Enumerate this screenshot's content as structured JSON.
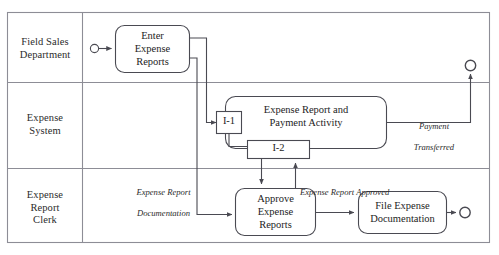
{
  "diagram": {
    "type": "activity-diagram-swimlanes",
    "colors": {
      "lane_border": "#8d8d96",
      "shape_stroke": "#4a4a52",
      "text": "#1d1d1d",
      "background": "#ffffff"
    },
    "lanes": [
      {
        "id": "lane-field-sales",
        "label": "Field Sales\nDepartment",
        "label_line1": "Field Sales",
        "label_line2": "Department"
      },
      {
        "id": "lane-expense-system",
        "label": "Expense\nSystem",
        "label_line1": "Expense",
        "label_line2": "System"
      },
      {
        "id": "lane-expense-report-clerk",
        "label": "Expense\nReport\nClerk",
        "label_line1": "Expense",
        "label_line2": "Report",
        "label_line3": "Clerk"
      }
    ],
    "activities": [
      {
        "id": "enter-expense-reports",
        "lane": "lane-field-sales",
        "lines": [
          "Enter",
          "Expense",
          "Reports"
        ]
      },
      {
        "id": "expense-report-and-payment-activity",
        "lane": "lane-expense-system",
        "lines": [
          "Expense Report and",
          "Payment Activity"
        ]
      },
      {
        "id": "approve-expense-reports",
        "lane": "lane-expense-report-clerk",
        "lines": [
          "Approve",
          "Expense",
          "Reports"
        ]
      },
      {
        "id": "file-expense-documentation",
        "lane": "lane-expense-report-clerk",
        "lines": [
          "File Expense",
          "Documentation"
        ]
      }
    ],
    "sync_bars": [
      {
        "id": "sync-bar-i1",
        "label": "I-1",
        "lane": "lane-expense-system"
      },
      {
        "id": "sync-bar-i2",
        "label": "I-2",
        "lane": "lane-expense-system"
      }
    ],
    "flow_labels": [
      {
        "id": "flow-label-payment-transferred",
        "line1": "Payment",
        "line2": "Transferred"
      },
      {
        "id": "flow-label-expense-report-documentation",
        "line1": "Expense Report",
        "line2": "Documentation"
      },
      {
        "id": "flow-label-expense-report-approved",
        "line1": "Expense Report Approved",
        "line2": ""
      }
    ],
    "terminators": [
      {
        "id": "start-node-field-sales",
        "kind": "start-circle"
      },
      {
        "id": "end-node-field-sales",
        "kind": "end-circle"
      },
      {
        "id": "end-node-clerk",
        "kind": "end-circle"
      }
    ]
  }
}
